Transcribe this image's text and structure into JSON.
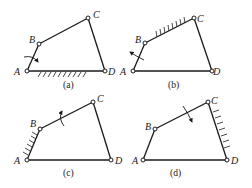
{
  "figure": {
    "panels": [
      {
        "caption": "(a)",
        "fixed_link": "AD",
        "rotating_marker_on": "AB",
        "points": {
          "A": [
            27,
            71
          ],
          "B": [
            39,
            44
          ],
          "C": [
            88,
            18
          ],
          "D": [
            105,
            71
          ]
        },
        "labels": {
          "A": "A",
          "B": "B",
          "C": "C",
          "D": "D"
        }
      },
      {
        "caption": "(b)",
        "fixed_link": "BC",
        "rotating_marker_on": "AB",
        "points": {
          "A": [
            133,
            71
          ],
          "B": [
            145,
            43
          ],
          "C": [
            194,
            18
          ],
          "D": [
            212,
            71
          ]
        },
        "labels": {
          "A": "A",
          "B": "B",
          "C": "C",
          "D": "D"
        }
      },
      {
        "caption": "(c)",
        "fixed_link": "AB",
        "rotating_marker_on": "BC",
        "points": {
          "A": [
            27,
            160
          ],
          "B": [
            40,
            129
          ],
          "C": [
            93,
            102
          ],
          "D": [
            111,
            160
          ]
        },
        "labels": {
          "A": "A",
          "B": "B",
          "C": "C",
          "D": "D"
        }
      },
      {
        "caption": "(d)",
        "fixed_link": "CD",
        "rotating_marker_on": "BC",
        "points": {
          "A": [
            143,
            160
          ],
          "B": [
            155,
            129
          ],
          "C": [
            208,
            102
          ],
          "D": [
            227,
            160
          ]
        },
        "labels": {
          "A": "A",
          "B": "B",
          "C": "C",
          "D": "D"
        }
      }
    ]
  },
  "captions": {
    "a": "(a)",
    "b": "(b)",
    "c": "(c)",
    "d": "(d)"
  },
  "labels": {
    "A": "A",
    "B": "B",
    "C": "C",
    "D": "D"
  }
}
